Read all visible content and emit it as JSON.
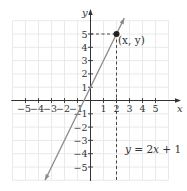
{
  "chart_data": {
    "type": "line",
    "title": "",
    "xlabel": "x",
    "ylabel": "y",
    "xlim": [
      -6,
      6
    ],
    "ylim": [
      -6,
      6
    ],
    "grid": true,
    "x_ticks": [
      -5,
      -4,
      -3,
      -2,
      -1,
      1,
      2,
      3,
      4,
      5
    ],
    "y_ticks": [
      -5,
      -4,
      -3,
      -2,
      -1,
      1,
      2,
      3,
      4,
      5
    ],
    "x_tick_labels": [
      "−5",
      "−4",
      "−3",
      "−2",
      "−1",
      "1",
      "2",
      "3",
      "4",
      "5"
    ],
    "y_tick_labels": [
      "−5",
      "−4",
      "−3",
      "−2",
      "−1",
      "1",
      "2",
      "3",
      "4",
      "5"
    ],
    "series": [
      {
        "name": "y = 2x + 1",
        "equation": "y = 2x + 1",
        "slope": 2,
        "intercept": 1,
        "x": [
          -3.5,
          2.6
        ],
        "y": [
          -6,
          6.2
        ],
        "color": "#8a8a8a"
      }
    ],
    "highlighted_point": {
      "x": 2,
      "y": 5,
      "label": "(x, y)"
    },
    "annotations": [
      {
        "text": "(x, y)",
        "at": [
          2,
          5
        ]
      },
      {
        "text": "y = 2x + 1",
        "at": [
          2.6,
          -3.8
        ]
      }
    ]
  },
  "labels": {
    "x_axis": "x",
    "y_axis": "y",
    "point": "(x, y)",
    "equation_y": "y",
    "equation_rest": " = 2",
    "equation_x": "x",
    "equation_tail": " + 1"
  }
}
